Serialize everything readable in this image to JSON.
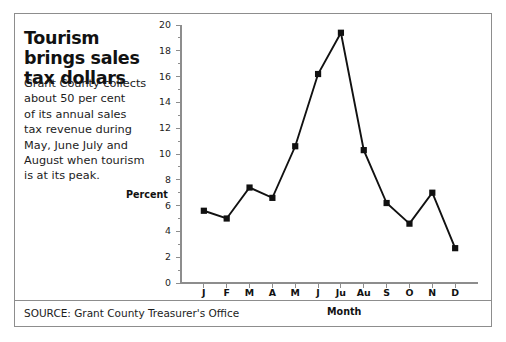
{
  "headline": "Tourism brings sales tax dollars",
  "deck_lines": [
    "Grant County collects",
    "about 50 per cent",
    "of its annual sales",
    "tax revenue during",
    "May, June July and",
    "August when tourism",
    "is at its peak."
  ],
  "source": "SOURCE: Grant County Treasurer's Office",
  "chart_data": {
    "type": "line",
    "title": "",
    "xlabel": "Month",
    "ylabel": "Percent",
    "categories": [
      "J",
      "F",
      "M",
      "A",
      "M",
      "J",
      "Ju",
      "Au",
      "S",
      "O",
      "N",
      "D"
    ],
    "category_full_names": [
      "January",
      "February",
      "March",
      "April",
      "May",
      "June",
      "July",
      "August",
      "September",
      "October",
      "November",
      "December"
    ],
    "values": [
      5.6,
      5.0,
      7.4,
      6.6,
      10.6,
      16.2,
      19.4,
      10.3,
      6.2,
      4.6,
      7.0,
      2.7
    ],
    "ylim": [
      0,
      20
    ],
    "ytick_values": [
      0,
      2,
      4,
      6,
      8,
      10,
      12,
      14,
      16,
      18,
      20
    ],
    "ytick_labels": [
      "0",
      "2",
      "4",
      "6",
      "8",
      "10",
      "12",
      "14",
      "16",
      "18",
      "20"
    ],
    "minor_ytick_step": 1,
    "grid": false,
    "legend": false,
    "marker": "square",
    "line_color": "#111111",
    "marker_color": "#111111",
    "axis_color": "#8d8d8d"
  },
  "colors": {
    "frame_border": "#8d8d8d",
    "text": "#1c1c1c",
    "headline": "#111111",
    "background": "#ffffff"
  }
}
